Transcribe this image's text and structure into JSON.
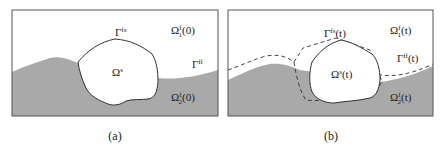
{
  "colors": {
    "fluid2_fill": "#a9a9a9",
    "fluid1_fill": "#ffffff",
    "solid_fill": "#ffffff",
    "outline": "#555555",
    "interface": "#333333"
  },
  "panels": [
    {
      "id": "a",
      "caption": "(a)",
      "labels": {
        "gamma_fs": {
          "base": "Γ",
          "sup": "fs",
          "arg": ""
        },
        "gamma_ff": {
          "base": "Γ",
          "sup": "ff",
          "arg": ""
        },
        "omega_s": {
          "base": "Ω",
          "sup": "s",
          "sub": "",
          "arg": ""
        },
        "omega_f1": {
          "base": "Ω",
          "sup": "f",
          "sub": "1",
          "arg": "(0)"
        },
        "omega_f2": {
          "base": "Ω",
          "sup": "f",
          "sub": "2",
          "arg": "(0)"
        }
      }
    },
    {
      "id": "b",
      "caption": "(b)",
      "labels": {
        "gamma_fs": {
          "base": "Γ",
          "sup": "fs",
          "arg": "(t)"
        },
        "gamma_ff": {
          "base": "Γ",
          "sup": "ff",
          "arg": "(t)"
        },
        "omega_s": {
          "base": "Ω",
          "sup": "s",
          "sub": "",
          "arg": "(t)"
        },
        "omega_f1": {
          "base": "Ω",
          "sup": "f",
          "sub": "1",
          "arg": "(t)"
        },
        "omega_f2": {
          "base": "Ω",
          "sup": "f",
          "sub": "2",
          "arg": "(t)"
        }
      },
      "legend_note": "dashed lines indicate initial configuration"
    }
  ]
}
